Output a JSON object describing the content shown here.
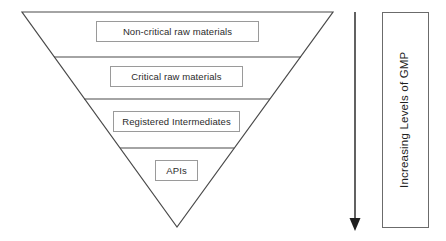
{
  "diagram": {
    "type": "inverted-pyramid",
    "title": "",
    "background_color": "#ffffff",
    "stroke_color": "#4a4a4a",
    "text_color": "#2b2b2b",
    "box_border_color": "#9a9a9a",
    "tiers": [
      {
        "label": "Non-critical raw materials"
      },
      {
        "label": "Critical raw materials"
      },
      {
        "label": "Registered Intermediates"
      },
      {
        "label": "APIs"
      }
    ]
  },
  "arrow": {
    "direction": "down",
    "color": "#1f1f1f"
  },
  "gmp_scale": {
    "label": "Increasing Levels of GMP",
    "orientation": "vertical-bottom-to-top",
    "border_color": "#6b6b6b"
  }
}
